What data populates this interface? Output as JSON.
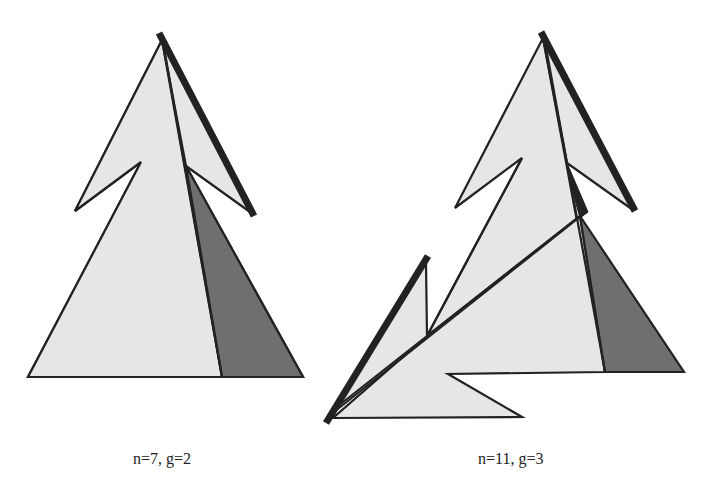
{
  "figures": [
    {
      "id": "left",
      "caption": "n=7, g=2",
      "pieces": [
        "light-triangle",
        "dark-triangle",
        "right-flap",
        "left-flap",
        "thick-edge"
      ]
    },
    {
      "id": "right",
      "caption": "n=11, g=3",
      "pieces": [
        "light-triangle",
        "dark-triangle",
        "right-flap",
        "left-flap",
        "lower-left-flap",
        "thick-edge-top",
        "thick-edge-bottom"
      ]
    }
  ],
  "colors": {
    "light_fill": "#e6e6e6",
    "dark_fill": "#6f6f6f",
    "stroke": "#222222",
    "background": "#ffffff"
  }
}
